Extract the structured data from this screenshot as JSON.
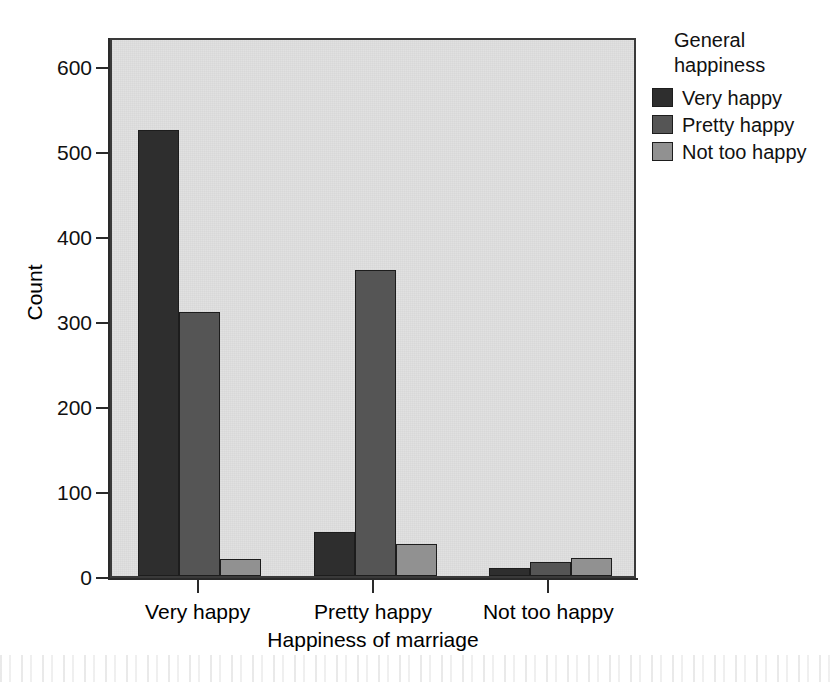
{
  "chart_data": {
    "type": "bar",
    "title": "",
    "subtitle": "",
    "xlabel": "Happiness of marriage",
    "ylabel": "Count",
    "categories": [
      "Very happy",
      "Pretty happy",
      "Not too happy"
    ],
    "series": [
      {
        "name": "Very happy",
        "values": [
          525,
          52,
          10
        ],
        "color": "#2e2e2e"
      },
      {
        "name": "Pretty happy",
        "values": [
          311,
          360,
          17
        ],
        "color": "#555555"
      },
      {
        "name": "Not too happy",
        "values": [
          20,
          38,
          21
        ],
        "color": "#919191"
      }
    ],
    "ylim": [
      0,
      640
    ],
    "yticks": [
      0,
      100,
      200,
      300,
      400,
      500,
      600
    ],
    "ytick_labels": [
      "0",
      "100",
      "200",
      "300",
      "400",
      "500",
      "600"
    ],
    "xtick_labels": [
      "Very happy",
      "Pretty happy",
      "Not too happy"
    ],
    "grid": false,
    "legend": {
      "title_line1": "General",
      "title_line2": "happiness",
      "position": "right-top",
      "entries": [
        {
          "label": "Very happy",
          "color": "#2e2e2e"
        },
        {
          "label": "Pretty happy",
          "color": "#555555"
        },
        {
          "label": "Not too happy",
          "color": "#919191"
        }
      ]
    },
    "plot_background": "#e0e0e0",
    "axis_color": "#2a2a2a",
    "bar_border_color": "#1d1d1d"
  }
}
